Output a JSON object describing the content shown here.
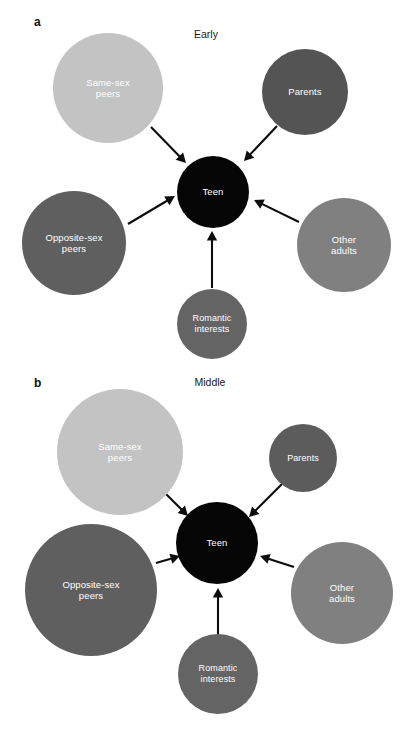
{
  "figure": {
    "background": "#ffffff",
    "width": 410,
    "height": 732,
    "arrow_color": "#0d0d0d",
    "label_text_color": "#ffffff"
  },
  "panels": [
    {
      "id": "a",
      "letter": "a",
      "title": "Early",
      "letter_pos": {
        "x": 34,
        "y": 16
      },
      "title_pos": {
        "x": 206,
        "y": 29
      },
      "teen_center": {
        "x": 213,
        "y": 192
      },
      "nodes": [
        {
          "key": "same-sex-peers",
          "label": "Same-sex\npeers",
          "color": "#c3c3c3",
          "cx": 108,
          "cy": 88,
          "r": 55,
          "size": "md"
        },
        {
          "key": "parents",
          "label": "Parents",
          "color": "#545454",
          "cx": 305,
          "cy": 92,
          "r": 43,
          "size": "md"
        },
        {
          "key": "opposite-sex-peers",
          "label": "Opposite-sex\npeers",
          "color": "#5f5f5f",
          "cx": 74,
          "cy": 243,
          "r": 52,
          "size": "md"
        },
        {
          "key": "other-adults",
          "label": "Other\nadults",
          "color": "#808080",
          "cx": 344,
          "cy": 245,
          "r": 47,
          "size": "md"
        },
        {
          "key": "romantic-interests",
          "label": "Romantic\ninterests",
          "color": "#646464",
          "cx": 212,
          "cy": 324,
          "r": 35,
          "size": "sm"
        },
        {
          "key": "teen",
          "label": "Teen",
          "color": "#050505",
          "cx": 213,
          "cy": 192,
          "r": 36,
          "size": "md"
        }
      ],
      "arrows": [
        {
          "key": "same-sex-peers-to-teen",
          "x1": 151,
          "y1": 127,
          "x2": 186,
          "y2": 163
        },
        {
          "key": "parents-to-teen",
          "x1": 277,
          "y1": 126,
          "x2": 244,
          "y2": 161
        },
        {
          "key": "opposite-sex-peers-to-teen",
          "x1": 128,
          "y1": 224,
          "x2": 175,
          "y2": 196
        },
        {
          "key": "other-adults-to-teen",
          "x1": 299,
          "y1": 222,
          "x2": 254,
          "y2": 200
        },
        {
          "key": "romantic-interests-to-teen",
          "x1": 212,
          "y1": 288,
          "x2": 212,
          "y2": 231
        }
      ]
    },
    {
      "id": "b",
      "letter": "b",
      "title": "Middle",
      "letter_pos": {
        "x": 34,
        "y": 11
      },
      "title_pos": {
        "x": 210,
        "y": 11
      },
      "teen_center": {
        "x": 217,
        "y": 177
      },
      "nodes": [
        {
          "key": "same-sex-peers",
          "label": "Same-sex\npeers",
          "color": "#c3c3c3",
          "cx": 120,
          "cy": 86,
          "r": 63,
          "size": "md"
        },
        {
          "key": "parents",
          "label": "Parents",
          "color": "#5c5c5c",
          "cx": 303,
          "cy": 92,
          "r": 34,
          "size": "sm"
        },
        {
          "key": "opposite-sex-peers",
          "label": "Opposite-sex\npeers",
          "color": "#5f5f5f",
          "cx": 91,
          "cy": 224,
          "r": 66,
          "size": "md"
        },
        {
          "key": "other-adults",
          "label": "Other\nadults",
          "color": "#808080",
          "cx": 342,
          "cy": 227,
          "r": 51,
          "size": "md"
        },
        {
          "key": "romantic-interests",
          "label": "Romantic\ninterests",
          "color": "#646464",
          "cx": 218,
          "cy": 308,
          "r": 40,
          "size": "sm"
        },
        {
          "key": "teen",
          "label": "Teen",
          "color": "#050505",
          "cx": 217,
          "cy": 177,
          "r": 41,
          "size": "md"
        }
      ],
      "arrows": [
        {
          "key": "same-sex-peers-to-teen",
          "x1": 166,
          "y1": 128,
          "x2": 188,
          "y2": 150
        },
        {
          "key": "parents-to-teen",
          "x1": 282,
          "y1": 118,
          "x2": 249,
          "y2": 151
        },
        {
          "key": "opposite-sex-peers-to-teen",
          "x1": 156,
          "y1": 197,
          "x2": 180,
          "y2": 190
        },
        {
          "key": "other-adults-to-teen",
          "x1": 294,
          "y1": 201,
          "x2": 260,
          "y2": 190
        },
        {
          "key": "romantic-interests-to-teen",
          "x1": 218,
          "y1": 271,
          "x2": 218,
          "y2": 222
        }
      ]
    }
  ]
}
